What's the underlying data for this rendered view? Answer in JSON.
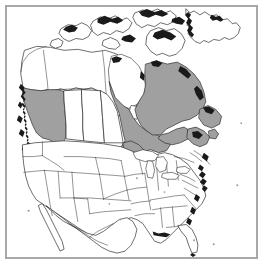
{
  "figure": {
    "description": "Outline map of North America with selected Canadian provinces shaded",
    "width_px": 265,
    "height_px": 266
  },
  "frame": {
    "border_color": "#a8a8a8",
    "background_color": "#ffffff",
    "border_width_px": 2,
    "inset_px": 5
  },
  "style": {
    "shaded_fill": "#a0a0a0",
    "unshaded_fill": "#ffffff",
    "outline_color": "#2b2b2b",
    "subdivision_color": "#3a3a3a",
    "coast_detail_color": "#1a1a1a"
  },
  "map": {
    "projection_note": "conic",
    "regions_shaded": [
      {
        "name": "British Columbia",
        "country": "Canada",
        "fill": "#a0a0a0"
      },
      {
        "name": "Ontario",
        "country": "Canada",
        "fill": "#a0a0a0"
      },
      {
        "name": "Quebec",
        "country": "Canada",
        "fill": "#a0a0a0"
      },
      {
        "name": "Labrador",
        "country": "Canada",
        "fill": "#a0a0a0"
      },
      {
        "name": "Newfoundland",
        "country": "Canada",
        "fill": "#a0a0a0"
      },
      {
        "name": "Nova Scotia",
        "country": "Canada",
        "fill": "#a0a0a0"
      },
      {
        "name": "New Brunswick",
        "country": "Canada",
        "fill": "#a0a0a0"
      }
    ],
    "regions_unshaded": [
      {
        "name": "Yukon",
        "country": "Canada"
      },
      {
        "name": "Northwest Territories",
        "country": "Canada"
      },
      {
        "name": "Nunavut",
        "country": "Canada"
      },
      {
        "name": "Alberta",
        "country": "Canada"
      },
      {
        "name": "Saskatchewan",
        "country": "Canada"
      },
      {
        "name": "Manitoba",
        "country": "Canada"
      },
      {
        "name": "Greenland",
        "country": "Denmark"
      },
      {
        "name": "Contiguous United States",
        "country": "United States"
      },
      {
        "name": "Northern Mexico",
        "country": "Mexico"
      }
    ],
    "water_bodies": [
      {
        "name": "Hudson Bay"
      },
      {
        "name": "Great Lakes"
      },
      {
        "name": "Gulf of Mexico"
      },
      {
        "name": "Pacific Ocean"
      },
      {
        "name": "Atlantic Ocean"
      }
    ],
    "labels": []
  }
}
